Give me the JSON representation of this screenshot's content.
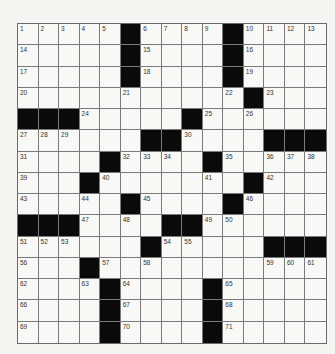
{
  "puzzle": {
    "rows": 15,
    "cols": 15,
    "layout": [
      ".....#....#....",
      ".....#....#....",
      ".....#....#....",
      "..........#.#...",
      "###.....#......",
      "......##....###",
      "....#....#.....",
      "...#.......#...",
      ".....#....#....",
      "###.....##.....",
      "......#.....###",
      "...#...........",
      "....#....#.....",
      "....#....#.....",
      "....#....#....."
    ],
    "numbers": [
      {
        "n": "1",
        "r": 0,
        "c": 0
      },
      {
        "n": "2",
        "r": 0,
        "c": 1
      },
      {
        "n": "3",
        "r": 0,
        "c": 2
      },
      {
        "n": "4",
        "r": 0,
        "c": 3
      },
      {
        "n": "5",
        "r": 0,
        "c": 4
      },
      {
        "n": "6",
        "r": 0,
        "c": 6
      },
      {
        "n": "7",
        "r": 0,
        "c": 7
      },
      {
        "n": "8",
        "r": 0,
        "c": 8
      },
      {
        "n": "9",
        "r": 0,
        "c": 9
      },
      {
        "n": "10",
        "r": 0,
        "c": 11
      },
      {
        "n": "11",
        "r": 0,
        "c": 12
      },
      {
        "n": "12",
        "r": 0,
        "c": 13
      },
      {
        "n": "13",
        "r": 0,
        "c": 14
      },
      {
        "n": "14",
        "r": 1,
        "c": 0
      },
      {
        "n": "15",
        "r": 1,
        "c": 6
      },
      {
        "n": "16",
        "r": 1,
        "c": 11
      },
      {
        "n": "17",
        "r": 2,
        "c": 0
      },
      {
        "n": "18",
        "r": 2,
        "c": 6
      },
      {
        "n": "19",
        "r": 2,
        "c": 11
      },
      {
        "n": "20",
        "r": 3,
        "c": 0
      },
      {
        "n": "21",
        "r": 3,
        "c": 5
      },
      {
        "n": "22",
        "r": 3,
        "c": 10
      },
      {
        "n": "23",
        "r": 3,
        "c": 12
      },
      {
        "n": "24",
        "r": 4,
        "c": 3
      },
      {
        "n": "25",
        "r": 4,
        "c": 9
      },
      {
        "n": "26",
        "r": 4,
        "c": 11
      },
      {
        "n": "27",
        "r": 5,
        "c": 0
      },
      {
        "n": "28",
        "r": 5,
        "c": 1
      },
      {
        "n": "29",
        "r": 5,
        "c": 2
      },
      {
        "n": "30",
        "r": 5,
        "c": 8
      },
      {
        "n": "31",
        "r": 6,
        "c": 0
      },
      {
        "n": "32",
        "r": 6,
        "c": 5
      },
      {
        "n": "33",
        "r": 6,
        "c": 6
      },
      {
        "n": "34",
        "r": 6,
        "c": 7
      },
      {
        "n": "35",
        "r": 6,
        "c": 10
      },
      {
        "n": "36",
        "r": 6,
        "c": 12
      },
      {
        "n": "37",
        "r": 6,
        "c": 13
      },
      {
        "n": "38",
        "r": 6,
        "c": 14
      },
      {
        "n": "39",
        "r": 7,
        "c": 0
      },
      {
        "n": "40",
        "r": 7,
        "c": 4
      },
      {
        "n": "41",
        "r": 7,
        "c": 9
      },
      {
        "n": "42",
        "r": 7,
        "c": 12
      },
      {
        "n": "43",
        "r": 8,
        "c": 0
      },
      {
        "n": "44",
        "r": 8,
        "c": 3
      },
      {
        "n": "45",
        "r": 8,
        "c": 6
      },
      {
        "n": "46",
        "r": 8,
        "c": 11
      },
      {
        "n": "47",
        "r": 9,
        "c": 3
      },
      {
        "n": "48",
        "r": 9,
        "c": 5
      },
      {
        "n": "49",
        "r": 9,
        "c": 9
      },
      {
        "n": "50",
        "r": 9,
        "c": 10
      },
      {
        "n": "51",
        "r": 10,
        "c": 0
      },
      {
        "n": "52",
        "r": 10,
        "c": 1
      },
      {
        "n": "53",
        "r": 10,
        "c": 2
      },
      {
        "n": "54",
        "r": 10,
        "c": 7
      },
      {
        "n": "55",
        "r": 10,
        "c": 8
      },
      {
        "n": "56",
        "r": 11,
        "c": 0
      },
      {
        "n": "57",
        "r": 11,
        "c": 4
      },
      {
        "n": "58",
        "r": 11,
        "c": 6
      },
      {
        "n": "59",
        "r": 11,
        "c": 12
      },
      {
        "n": "60",
        "r": 11,
        "c": 13
      },
      {
        "n": "61",
        "r": 11,
        "c": 14
      },
      {
        "n": "62",
        "r": 12,
        "c": 0
      },
      {
        "n": "63",
        "r": 12,
        "c": 3
      },
      {
        "n": "64",
        "r": 12,
        "c": 5
      },
      {
        "n": "65",
        "r": 12,
        "c": 10
      },
      {
        "n": "66",
        "r": 13,
        "c": 0
      },
      {
        "n": "67",
        "r": 13,
        "c": 5
      },
      {
        "n": "68",
        "r": 13,
        "c": 10
      },
      {
        "n": "69",
        "r": 14,
        "c": 0
      },
      {
        "n": "70",
        "r": 14,
        "c": 5
      },
      {
        "n": "71",
        "r": 14,
        "c": 10
      }
    ]
  },
  "colors": {
    "block": "#0a0a0a",
    "cell": "#f8f8f6",
    "gridline": "#7a7a7a",
    "number_text": "#333333"
  }
}
